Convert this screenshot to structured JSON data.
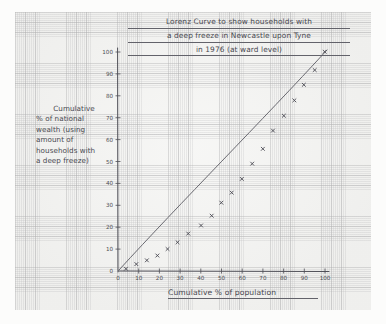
{
  "medium": "hand-drawn pencil on graph paper",
  "title": {
    "line1": "Lorenz Curve to show households with",
    "line2": "a deep freeze in Newcastle upon Tyne",
    "line3": "in 1976 (at ward level)"
  },
  "y_caption": {
    "line1": "Cumulative",
    "line2": "% of national",
    "line3": "wealth (using",
    "line4": "amount of",
    "line5": "households with",
    "line6": "a deep freeze)"
  },
  "x_caption": "Cumulative % of population",
  "chart_data": {
    "type": "scatter",
    "title": "Lorenz Curve to show households with a deep freeze in Newcastle upon Tyne in 1976 (at ward level)",
    "xlabel": "Cumulative % of population",
    "ylabel": "Cumulative % of national wealth (using amount of households with a deep freeze)",
    "xlim": [
      0,
      100
    ],
    "ylim": [
      0,
      100
    ],
    "xticks": [
      0,
      10,
      20,
      30,
      40,
      50,
      60,
      70,
      80,
      90,
      100
    ],
    "yticks": [
      0,
      10,
      20,
      30,
      40,
      50,
      60,
      70,
      80,
      90,
      100
    ],
    "grid": true,
    "legend": "none",
    "series": [
      {
        "name": "Line of equality",
        "type": "line",
        "x": [
          0,
          100
        ],
        "values": [
          0,
          100
        ]
      },
      {
        "name": "Lorenz curve (plotted points)",
        "type": "scatter",
        "x": [
          4,
          9,
          14,
          19,
          24,
          29,
          34,
          40,
          45,
          50,
          55,
          60,
          65,
          70,
          75,
          80,
          85,
          90,
          95,
          100
        ],
        "values": [
          1,
          3,
          5,
          7,
          10,
          13,
          17,
          21,
          25,
          31,
          36,
          42,
          49,
          56,
          64,
          71,
          78,
          85,
          92,
          100
        ]
      }
    ]
  }
}
